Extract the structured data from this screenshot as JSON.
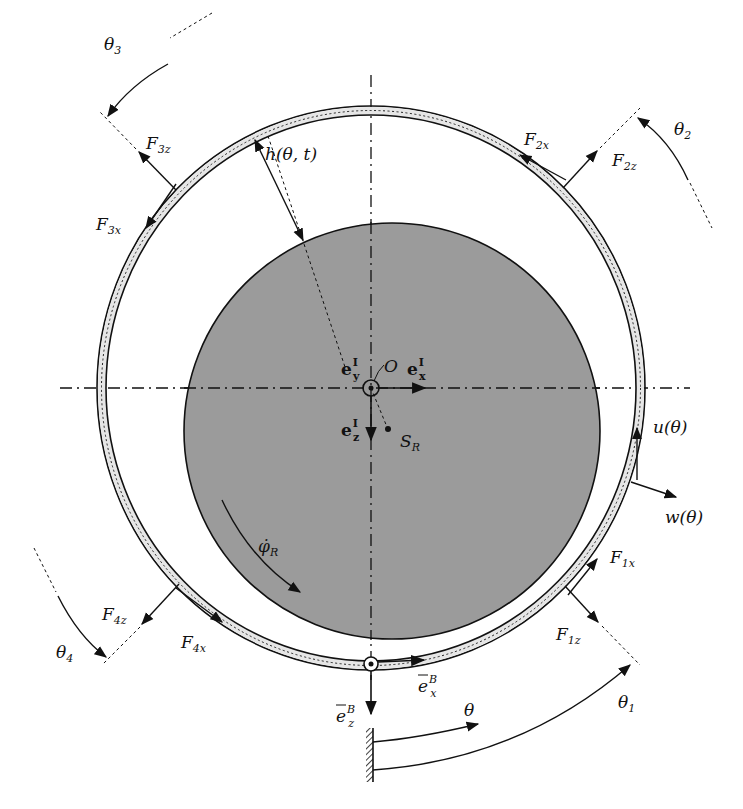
{
  "diagram": {
    "colors": {
      "background": "#ffffff",
      "rotor_fill": "#9b9b9b",
      "ring_fill": "#e6e6e6",
      "stroke": "#111111"
    },
    "labels": {
      "theta1": "θ",
      "theta1_sub": "1",
      "theta2": "θ",
      "theta2_sub": "2",
      "theta3": "θ",
      "theta3_sub": "3",
      "theta4": "θ",
      "theta4_sub": "4",
      "theta": "θ",
      "F1x": "F",
      "F1x_sub": "1x",
      "F1z": "F",
      "F1z_sub": "1z",
      "F2x": "F",
      "F2x_sub": "2x",
      "F2z": "F",
      "F2z_sub": "2z",
      "F3x": "F",
      "F3x_sub": "3x",
      "F3z": "F",
      "F3z_sub": "3z",
      "F4x": "F",
      "F4x_sub": "4x",
      "F4z": "F",
      "F4z_sub": "4z",
      "gap": "h(θ, t)",
      "u": "u(θ)",
      "w": "w(θ)",
      "origin": "O",
      "rotor_center": "S",
      "rotor_center_sub": "R",
      "ex_I": "e",
      "ex_I_sup": "I",
      "ex_I_sub": "x",
      "ey_I": "e",
      "ey_I_sup": "I",
      "ey_I_sub": "y",
      "ez_I": "e",
      "ez_I_sup": "I",
      "ez_I_sub": "z",
      "ex_B": "e",
      "ex_B_sup": "B",
      "ex_B_sub": "x",
      "ez_B": "e",
      "ez_B_sup": "B",
      "ez_B_sub": "z",
      "phi_dot": "φ̇",
      "phi_dot_sub": "R"
    }
  }
}
